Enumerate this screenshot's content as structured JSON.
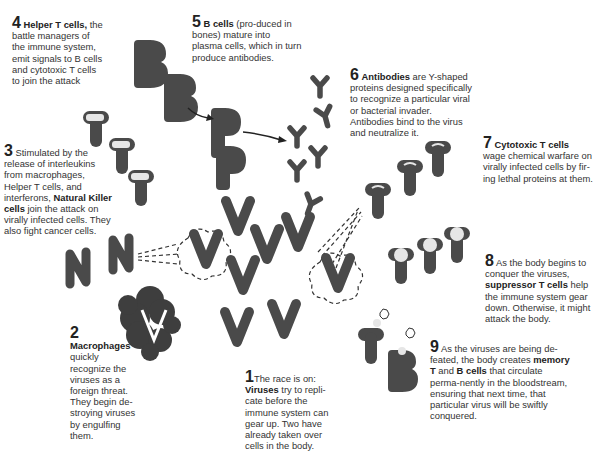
{
  "colors": {
    "cell": "#4a4a4a",
    "text": "#333333",
    "highlight": "#e6e6e6",
    "background": "#ffffff"
  },
  "captions": {
    "c1": {
      "num": "1",
      "pre": "The race is on: ",
      "bold": "Viruses",
      "post": " try to repli-cate before the immune system can gear up. Two have already taken over cells in the body."
    },
    "c2": {
      "num": "2",
      "bold": "Macrophages",
      "post": "quickly recognize the viruses as a foreign threat. They begin de-stroying viruses by engulfing them."
    },
    "c3": {
      "num": "3",
      "pre": " Stimulated by the release of interleukins from macrophages, Helper T cells, and interferons, ",
      "bold": "Natural Killer cells",
      "post": " join the attack on virally infected cells. They also fight cancer cells."
    },
    "c4": {
      "num": "4",
      "bold": "Helper T cells,",
      "post": " the battle managers of the immune system, emit signals to B cells and cytotoxic T cells to join the attack"
    },
    "c5": {
      "num": "5",
      "bold": "B cells",
      "post": " (pro-duced in bones) mature into plasma cells, which in turn produce antibodies."
    },
    "c6": {
      "num": "6",
      "bold": "Antibodies",
      "post": " are Y-shaped proteins designed specifically to recognize a particular viral or bacterial invader. Antibodies bind to the virus and neutralize it."
    },
    "c7": {
      "num": "7",
      "bold": "Cytotoxic T cells",
      "post": "wage chemical warfare on virally infected cells by fir-ing lethal proteins at them."
    },
    "c8": {
      "num": "8",
      "pre": " As the body begins to conquer the viruses, ",
      "bold": "suppressor T cells",
      "post": " help the immune system gear down. Otherwise, it might attack the body."
    },
    "c9": {
      "num": "9",
      "pre": " As the viruses are being de-feated, the body creates ",
      "bold": "memory",
      "mid": "T",
      "mid2": " and ",
      "bold2": "B cells",
      "post": " that circulate perma-nently in the bloodstream, ensuring that next time, that particular virus will be swiftly conquered."
    }
  },
  "icons": [
    "helper-t-cell-icon",
    "b-cell-icon",
    "plasma-cell-icon",
    "antibody-icon",
    "cytotoxic-t-cell-icon",
    "suppressor-t-cell-icon",
    "natural-killer-cell-icon",
    "virus-icon",
    "infected-cell-icon",
    "macrophage-icon",
    "memory-t-cell-icon",
    "memory-b-cell-icon",
    "arrow-icon"
  ]
}
